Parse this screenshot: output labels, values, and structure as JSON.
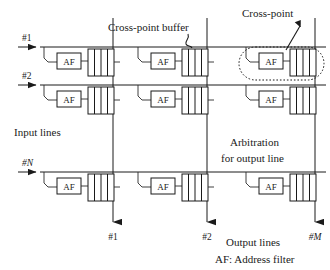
{
  "figure": {
    "title_text": "Cross-point buffered switch diagram",
    "annotations": {
      "crosspoint_buffer": "Cross-point buffer",
      "crosspoint": "Cross-point",
      "input_lines": "Input lines",
      "output_lines": "Output lines",
      "arbitration_line1": "Arbitration",
      "arbitration_line2": "for output line",
      "legend": "AF: Address filter"
    },
    "input_labels": [
      "#1",
      "#2",
      "#N"
    ],
    "output_labels": [
      "#1",
      "#2",
      "#M"
    ],
    "cell_label": "AF",
    "colors": {
      "ink": "#1a1a1a",
      "paper": "#ffffff"
    },
    "geometry": {
      "buffer_cells": 4,
      "rows": 3,
      "columns": 3
    }
  }
}
